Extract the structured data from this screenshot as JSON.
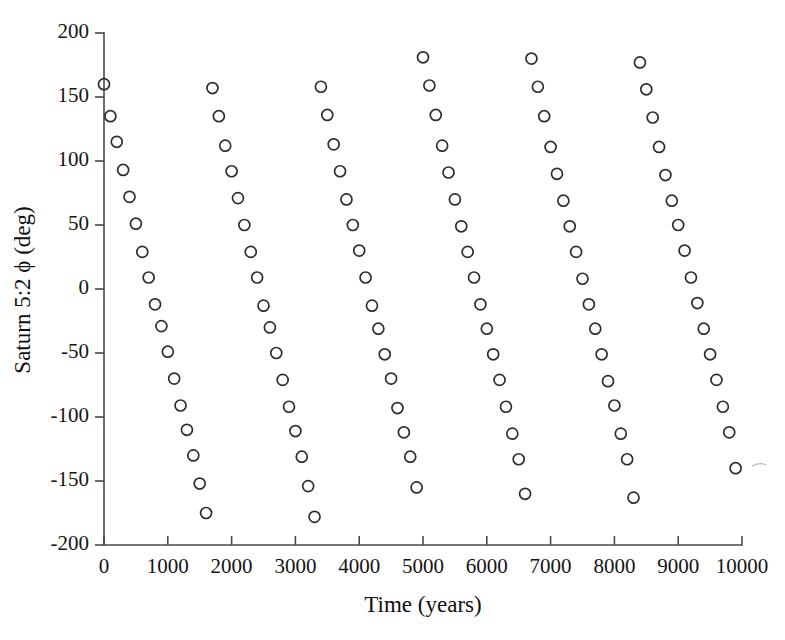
{
  "figure": {
    "background": "#ffffff",
    "foreground": "#1a1a1a",
    "marker_color": "#2e2e2e",
    "axis_color": "#4a4a4a"
  },
  "chart_data": {
    "type": "scatter",
    "title": "",
    "xlabel": "Time (years)",
    "ylabel": "Saturn 5:2 ϕ (deg)",
    "xlim": [
      0,
      10000
    ],
    "ylim": [
      -200,
      200
    ],
    "xticks": [
      0,
      1000,
      2000,
      3000,
      4000,
      5000,
      6000,
      7000,
      8000,
      9000,
      10000
    ],
    "xticklabels": [
      "0",
      "1000",
      "2000",
      "3000",
      "4000",
      "5000",
      "6000",
      "7000",
      "8000",
      "9000",
      "10000"
    ],
    "yticks": [
      -200,
      -150,
      -100,
      -50,
      0,
      50,
      100,
      150,
      200
    ],
    "yticklabels": [
      "-200",
      "-150",
      "-100",
      "-50",
      "0",
      "50",
      "100",
      "150",
      "200"
    ],
    "grid": false,
    "legend": null,
    "marker": "open-circle",
    "marker_size_px": 11,
    "series": [
      {
        "name": "Saturn 5:2 resonance angle",
        "description": "Circulating resonance angle sampled every 100 years; phi decreases about 20 deg per sample and wraps modulo 360 into [-180,180], producing descending diagonal streaks.",
        "sample_interval_years": 100,
        "phi_rate_deg_per_sample": -20.4,
        "phi_start_deg": 160,
        "n_points": 100,
        "x": [
          0,
          100,
          200,
          300,
          400,
          500,
          600,
          700,
          800,
          900,
          1000,
          1100,
          1200,
          1300,
          1400,
          1500,
          1600,
          1700,
          1800,
          1900,
          2000,
          2100,
          2200,
          2300,
          2400,
          2500,
          2600,
          2700,
          2800,
          2900,
          3000,
          3100,
          3200,
          3300,
          3400,
          3500,
          3600,
          3700,
          3800,
          3900,
          4000,
          4100,
          4200,
          4300,
          4400,
          4500,
          4600,
          4700,
          4800,
          4900,
          5000,
          5100,
          5200,
          5300,
          5400,
          5500,
          5600,
          5700,
          5800,
          5900,
          6000,
          6100,
          6200,
          6300,
          6400,
          6500,
          6600,
          6700,
          6800,
          6900,
          7000,
          7100,
          7200,
          7300,
          7400,
          7500,
          7600,
          7700,
          7800,
          7900,
          8000,
          8100,
          8200,
          8300,
          8400,
          8500,
          8600,
          8700,
          8800,
          8900,
          9000,
          9100,
          9200,
          9300,
          9400,
          9500,
          9600,
          9700,
          9800,
          9900
        ],
        "y": [
          160,
          135,
          115,
          93,
          72,
          51,
          29,
          9,
          -12,
          -29,
          -49,
          -70,
          -91,
          -110,
          -130,
          -152,
          -175,
          157,
          135,
          112,
          92,
          71,
          50,
          29,
          9,
          -13,
          -30,
          -50,
          -71,
          -92,
          -111,
          -131,
          -154,
          -178,
          158,
          136,
          113,
          92,
          70,
          50,
          30,
          9,
          -13,
          -31,
          -51,
          -70,
          -93,
          -112,
          -131,
          -155,
          181,
          159,
          136,
          112,
          91,
          70,
          49,
          29,
          9,
          -12,
          -31,
          -51,
          -71,
          -92,
          -113,
          -133,
          -160,
          180,
          158,
          135,
          111,
          90,
          69,
          49,
          29,
          8,
          -12,
          -31,
          -51,
          -72,
          -91,
          -113,
          -133,
          -163,
          177,
          156,
          134,
          111,
          89,
          69,
          50,
          30,
          9,
          -11,
          -31,
          -51,
          -71,
          -92,
          -112,
          -140
        ]
      }
    ]
  }
}
